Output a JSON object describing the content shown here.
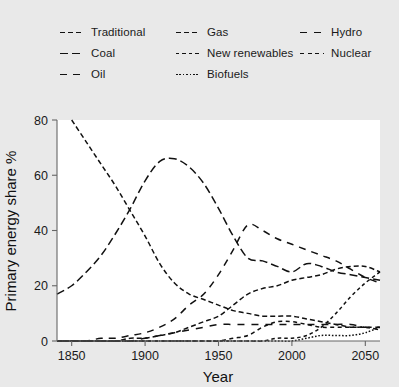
{
  "chart_data": {
    "type": "line",
    "title": "",
    "xlabel": "Year",
    "ylabel": "Primary energy share %",
    "xlim": [
      1840,
      2060
    ],
    "ylim": [
      0,
      80
    ],
    "xticks": [
      1850,
      1900,
      1950,
      2000,
      2050
    ],
    "yticks": [
      0,
      20,
      40,
      60,
      80
    ],
    "grid": false,
    "legend_position": "top",
    "legend_columns": 3,
    "line_color": "#111111",
    "background_color": "#e9e9e9",
    "plot_background_color": "#ffffff",
    "x": [
      1840,
      1850,
      1860,
      1870,
      1880,
      1890,
      1900,
      1910,
      1920,
      1930,
      1940,
      1950,
      1960,
      1970,
      1980,
      1990,
      2000,
      2010,
      2020,
      2030,
      2040,
      2050,
      2060
    ],
    "series": [
      {
        "name": "Traditional",
        "label": "Traditional",
        "dash": "dash-traditional",
        "values": [
          null,
          80,
          72,
          64,
          56,
          47,
          38,
          28,
          21,
          17,
          15,
          13,
          11,
          10,
          9,
          9,
          9,
          8,
          7,
          6,
          5,
          5,
          4
        ]
      },
      {
        "name": "Coal",
        "label": "Coal",
        "dash": "dash-coal",
        "values": [
          17,
          20,
          25,
          31,
          39,
          48,
          58,
          65,
          66,
          63,
          57,
          48,
          38,
          30,
          29,
          27,
          25,
          28,
          27,
          25,
          24,
          23,
          22
        ]
      },
      {
        "name": "Oil",
        "label": "Oil",
        "dash": "dash-oil",
        "values": [
          0,
          0,
          0,
          1,
          1,
          2,
          3,
          5,
          8,
          13,
          17,
          24,
          33,
          42,
          40,
          37,
          35,
          33,
          31,
          29,
          26,
          23,
          21
        ]
      },
      {
        "name": "Gas",
        "label": "Gas",
        "dash": "dash-gas",
        "values": [
          0,
          0,
          0,
          0,
          0,
          1,
          1,
          2,
          3,
          5,
          7,
          9,
          13,
          17,
          19,
          20,
          22,
          23,
          24,
          26,
          27,
          27,
          25
        ]
      },
      {
        "name": "New renewables",
        "label": "New renewables",
        "dash": "dash-new-renewables",
        "values": [
          0,
          0,
          0,
          0,
          0,
          0,
          0,
          0,
          0,
          0,
          0,
          0,
          0,
          0,
          0,
          1,
          1,
          2,
          5,
          10,
          16,
          21,
          25
        ]
      },
      {
        "name": "Biofuels",
        "label": "Biofuels",
        "dash": "dash-biofuels",
        "values": [
          0,
          0,
          0,
          0,
          0,
          0,
          0,
          0,
          0,
          0,
          0,
          0,
          0,
          0,
          0,
          0,
          0,
          1,
          2,
          2,
          2,
          3,
          5
        ]
      },
      {
        "name": "Hydro",
        "label": "Hydro",
        "dash": "dash-hydro",
        "values": [
          0,
          0,
          0,
          0,
          0,
          0,
          1,
          2,
          3,
          4,
          5,
          6,
          6,
          6,
          6,
          6,
          6,
          6,
          6,
          6,
          6,
          5,
          5
        ]
      },
      {
        "name": "Nuclear",
        "label": "Nuclear",
        "dash": "dash-nuclear",
        "values": [
          0,
          0,
          0,
          0,
          0,
          0,
          0,
          0,
          0,
          0,
          0,
          0,
          1,
          2,
          5,
          7,
          7,
          6,
          5,
          5,
          5,
          5,
          5
        ]
      }
    ],
    "legend": [
      {
        "label": "Traditional",
        "dash": "dash-traditional",
        "column": 1
      },
      {
        "label": "Coal",
        "dash": "dash-coal",
        "column": 1
      },
      {
        "label": "Oil",
        "dash": "dash-oil",
        "column": 1
      },
      {
        "label": "Gas",
        "dash": "dash-gas",
        "column": 2
      },
      {
        "label": "New renewables",
        "dash": "dash-new-renewables",
        "column": 2
      },
      {
        "label": "Biofuels",
        "dash": "dash-biofuels",
        "column": 2
      },
      {
        "label": "Hydro",
        "dash": "dash-hydro",
        "column": 3
      },
      {
        "label": "Nuclear",
        "dash": "dash-nuclear",
        "column": 3
      }
    ]
  }
}
